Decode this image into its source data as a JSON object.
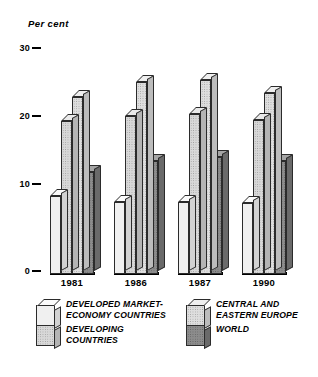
{
  "chart_data": {
    "type": "bar",
    "title": "",
    "subtitle": "",
    "ylabel": "Per cent",
    "xlabel": "",
    "categories": [
      "1981",
      "1986",
      "1987",
      "1990"
    ],
    "ylim": [
      0,
      30
    ],
    "yticks": [
      0,
      10,
      20,
      30
    ],
    "ytick_labels": [
      "0",
      "10",
      "20",
      "30"
    ],
    "grid": false,
    "legend_position": "bottom",
    "style": "3d-grouped-bars",
    "series": [
      {
        "name": "DEVELOPED MARKET-ECONOMY COUNTRIES",
        "key": "developed-market-economy-countries",
        "fill": "#f0f0f0",
        "values": [
          11.5,
          10.6,
          10.6,
          10.5
        ]
      },
      {
        "name": "DEVELOPING COUNTRIES",
        "key": "developing-countries",
        "fill": "#d8d8d8",
        "values": [
          22.5,
          23.2,
          23.6,
          22.6
        ]
      },
      {
        "name": "CENTRAL AND EASTERN EUROPE",
        "key": "central-and-eastern-europe",
        "fill": "#dedede",
        "values": [
          26.0,
          28.2,
          28.6,
          26.6
        ]
      },
      {
        "name": "WORLD",
        "key": "world",
        "fill": "#8c8c8c",
        "values": [
          15.0,
          16.6,
          17.2,
          16.6
        ]
      }
    ]
  },
  "axis": {
    "unit_label": "Per cent",
    "ticks": [
      {
        "label": "30",
        "value": 30
      },
      {
        "label": "20",
        "value": 20
      },
      {
        "label": "10",
        "value": 10
      },
      {
        "label": "0",
        "value": 0
      }
    ]
  },
  "groups": [
    {
      "year": "1981"
    },
    {
      "year": "1986"
    },
    {
      "year": "1987"
    },
    {
      "year": "1990"
    }
  ],
  "legend": {
    "left": {
      "item_a": "DEVELOPED MARKET-\nECONOMY COUNTRIES",
      "item_b": "DEVELOPING\nCOUNTRIES"
    },
    "right": {
      "item_a": "CENTRAL AND\nEASTERN EUROPE",
      "item_b": "WORLD"
    }
  },
  "colors": {
    "series_developed": "#f0f0f0",
    "series_developing": "#d8d8d8",
    "series_central_eastern_europe": "#dedede",
    "series_world": "#8c8c8c",
    "outline": "#2b2b2b",
    "background": "#ffffff"
  }
}
